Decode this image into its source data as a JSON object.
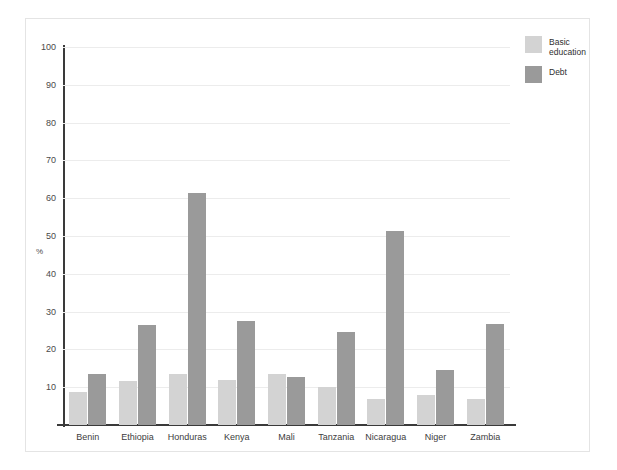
{
  "chart_data": {
    "type": "bar",
    "title": "",
    "xlabel": "",
    "ylabel": "%",
    "ylim": [
      0,
      100
    ],
    "ytick_step": 10,
    "yticks": [
      100,
      90,
      80,
      70,
      60,
      50,
      40,
      30,
      20,
      10
    ],
    "grid": true,
    "legend_position": "right-top",
    "categories": [
      "Benin",
      "Ethiopia",
      "Honduras",
      "Kenya",
      "Mali",
      "Tanzania",
      "Nicaragua",
      "Niger",
      "Zambia"
    ],
    "series": [
      {
        "name": "Basic\neducation",
        "name_flat": "Basic education",
        "color": "#d3d3d3",
        "values": [
          8.8,
          11.7,
          13.4,
          11.8,
          13.6,
          10.0,
          6.8,
          8.0,
          6.9
        ]
      },
      {
        "name": "Debt",
        "name_flat": "Debt",
        "color": "#9a9a9a",
        "values": [
          13.5,
          26.5,
          61.3,
          27.5,
          12.6,
          24.5,
          51.2,
          14.6,
          26.6
        ]
      }
    ]
  },
  "colors": {
    "education": "#d3d3d3",
    "debt": "#9a9a9a",
    "axis": "#3a3a3a",
    "grid": "#ececec",
    "frame": "#e4e4e4",
    "background": "#ffffff"
  },
  "legend": {
    "items": [
      {
        "label": "Basic\neducation",
        "color_key": "education"
      },
      {
        "label": "Debt",
        "color_key": "debt"
      }
    ]
  }
}
